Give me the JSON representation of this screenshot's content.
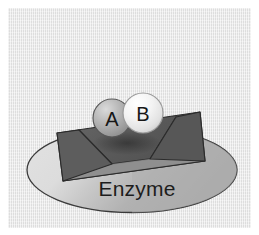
{
  "figure": {
    "background_color": "#e7e7e7",
    "border_color": "#ffffff"
  },
  "enzyme": {
    "label": "Enzyme",
    "body_color": "#b6b6b6",
    "body_outline_color": "#3a3a3a",
    "active_site_block_color": "#5c5c5c",
    "active_site_floor_color": "#9a9a9a",
    "active_site_outline_color": "#2b2b2b"
  },
  "substrates": [
    {
      "label": "A",
      "name": "substrate-a",
      "fill_color": "#a8a8a8",
      "highlight_color": "#d2d2d2",
      "outline_color": "#4a4a4a",
      "cx": 112,
      "cy": 118,
      "r": 19
    },
    {
      "label": "B",
      "name": "substrate-b",
      "fill_color": "#eeeeee",
      "highlight_color": "#fbfbfb",
      "outline_color": "#8c8c8c",
      "cx": 143,
      "cy": 113,
      "r": 20
    }
  ]
}
